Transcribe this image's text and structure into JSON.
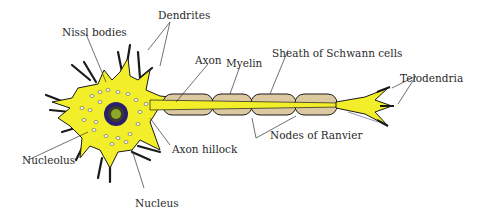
{
  "diagram": {
    "colors": {
      "cytoplasm": "#f2ef2a",
      "myelin": "#dcc9a0",
      "outline": "#1a1a1a",
      "nucleus": "#2a1f6e",
      "nucleolus": "#8fa82a",
      "leader": "#333333"
    },
    "labels": {
      "dendrites": "Dendrites",
      "nissl_bodies": "Nissl bodies",
      "axon": "Axon",
      "myelin": "Myelin",
      "sheath": "Sheath of Schwann cells",
      "telodendria": "Telodendria",
      "nucleolus": "Nucleolus",
      "axon_hillock": "Axon hillock",
      "nodes_of_ranvier": "Nodes of Ranvier",
      "nucleus": "Nucleus"
    }
  }
}
